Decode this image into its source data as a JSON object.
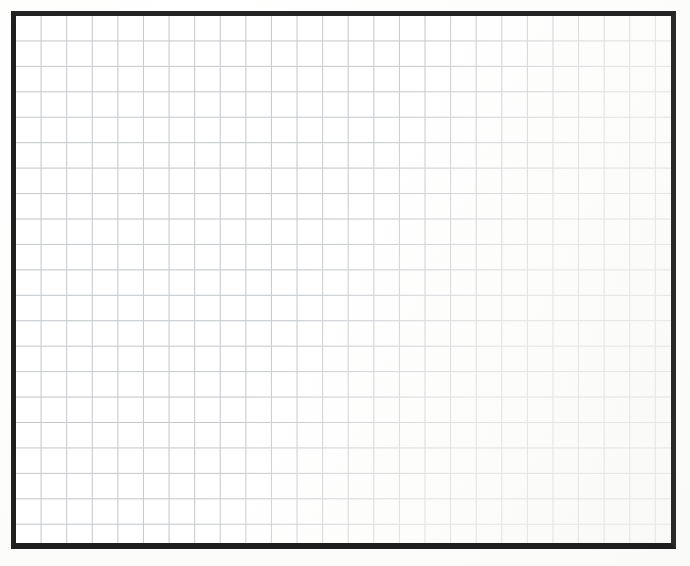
{
  "document": {
    "kind": "blank-grid-sheet",
    "background_color": "#fdfdfc",
    "sheet_color": "#ffffff"
  },
  "frame": {
    "name": "grid-border-frame",
    "color": "#242424",
    "thickness_px": 5,
    "left_px": 11,
    "top_px": 11,
    "width_px": 665,
    "height_px": 538
  },
  "grid": {
    "line_color": "#b9bdc1",
    "cell_width_px": 25.6,
    "cell_height_px": 25.45,
    "columns": 25,
    "rows": 21
  },
  "chart_data": {
    "type": "table",
    "title": "",
    "subtitle": "",
    "xlabel": "",
    "ylabel": "",
    "columns": 25,
    "rows": 21,
    "cell_values": [],
    "legend": [],
    "annotations": [],
    "grid": true
  }
}
